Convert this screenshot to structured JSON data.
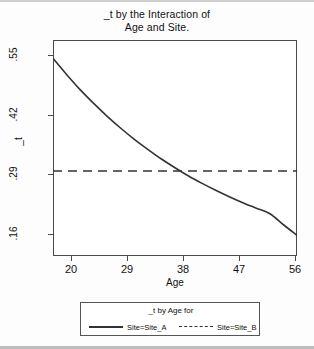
{
  "chart_data": {
    "type": "line",
    "title": "_t by the Interaction of Age and Site.",
    "title_line1": "_t by the Interaction of",
    "title_line2": "Age and Site.",
    "xlabel": "Age",
    "ylabel": "_t",
    "xlim": [
      20,
      56
    ],
    "ylim": [
      0.115,
      0.585
    ],
    "xticks": [
      20,
      29,
      38,
      47,
      56
    ],
    "xtick_labels": [
      "20",
      "29",
      "38",
      "47",
      "56"
    ],
    "yticks": [
      0.55,
      0.42,
      0.29,
      0.16
    ],
    "ytick_labels": [
      ".55",
      ".42",
      ".29",
      ".16"
    ],
    "grid": false,
    "legend_position": "bottom",
    "legend_title": "_t by Age for",
    "series": [
      {
        "name": "Site=Site_A",
        "style": "solid",
        "color": "#333333",
        "x": [
          20,
          22,
          24,
          26,
          28,
          30,
          32,
          34,
          36,
          38,
          40,
          42,
          44,
          46,
          48,
          50,
          52,
          54,
          56
        ],
        "values": [
          0.545,
          0.51,
          0.477,
          0.447,
          0.419,
          0.393,
          0.369,
          0.347,
          0.326,
          0.307,
          0.289,
          0.273,
          0.258,
          0.244,
          0.231,
          0.219,
          0.207,
          0.183,
          0.16
        ]
      },
      {
        "name": "Site=Site_B",
        "style": "dashed",
        "color": "#333333",
        "x": [
          20,
          56
        ],
        "values": [
          0.3,
          0.3
        ]
      }
    ],
    "annotations": [
      {
        "text": "curves intersect near Age 37",
        "x": 37,
        "y": 0.3
      }
    ]
  },
  "legend": {
    "title": "_t by Age for",
    "entries": [
      {
        "label": "Site=Site_A",
        "style": "solid"
      },
      {
        "label": "Site=Site_B",
        "style": "dashed"
      }
    ]
  }
}
